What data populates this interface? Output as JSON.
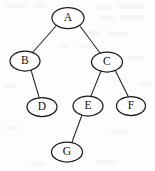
{
  "figure": {
    "kind": "tree-diagram",
    "width": 155,
    "height": 171,
    "background_color": "#fdfdfd",
    "node_fill_color": "#ffffff",
    "node_stroke_color": "#1b1b1b",
    "edge_color": "#272727",
    "label_color": "#111111"
  },
  "nodes": [
    {
      "id": "A",
      "label": "A",
      "cx": 68,
      "cy": 18,
      "rx": 16.0,
      "ry": 10.5
    },
    {
      "id": "B",
      "label": "B",
      "cx": 25,
      "cy": 61,
      "rx": 15.0,
      "ry": 10.0
    },
    {
      "id": "C",
      "label": "C",
      "cx": 107,
      "cy": 62,
      "rx": 15.5,
      "ry": 10.0
    },
    {
      "id": "D",
      "label": "D",
      "cx": 42,
      "cy": 107,
      "rx": 15.0,
      "ry": 9.5
    },
    {
      "id": "E",
      "label": "E",
      "cx": 88,
      "cy": 106,
      "rx": 15.0,
      "ry": 10.0
    },
    {
      "id": "F",
      "label": "F",
      "cx": 131,
      "cy": 106,
      "rx": 14.5,
      "ry": 9.5
    },
    {
      "id": "G",
      "label": "G",
      "cx": 67,
      "cy": 152,
      "rx": 15.5,
      "ry": 10.0
    }
  ],
  "edges": [
    {
      "id": "A-B",
      "from": "A",
      "to": "B",
      "x1": 56,
      "y1": 26,
      "x2": 33,
      "y2": 52
    },
    {
      "id": "A-C",
      "from": "A",
      "to": "C",
      "x1": 80,
      "y1": 26,
      "x2": 100,
      "y2": 53
    },
    {
      "id": "B-D",
      "from": "B",
      "to": "D",
      "x1": 31,
      "y1": 70,
      "x2": 39,
      "y2": 97
    },
    {
      "id": "C-E",
      "from": "C",
      "to": "E",
      "x1": 101,
      "y1": 71,
      "x2": 91,
      "y2": 96
    },
    {
      "id": "C-F",
      "from": "C",
      "to": "F",
      "x1": 115,
      "y1": 70,
      "x2": 128,
      "y2": 96
    },
    {
      "id": "E-G",
      "from": "E",
      "to": "G",
      "x1": 82,
      "y1": 115,
      "x2": 72,
      "y2": 142
    }
  ]
}
